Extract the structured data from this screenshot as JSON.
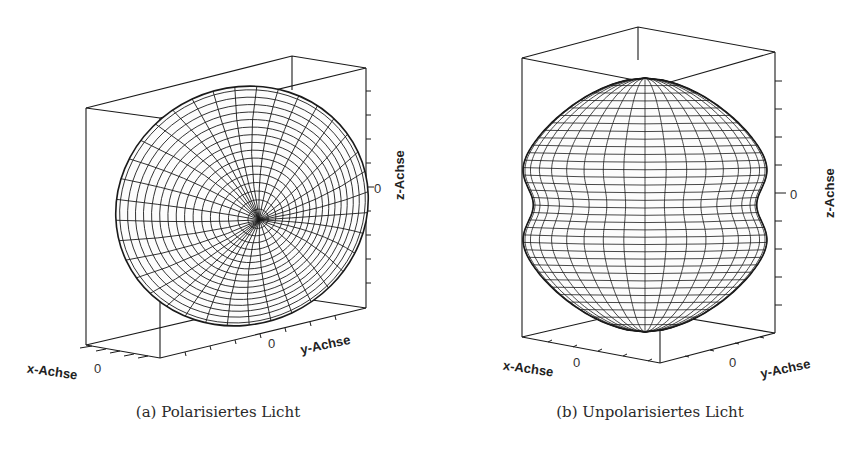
{
  "figures": [
    {
      "id": "a",
      "caption": "(a) Polarisiertes Licht",
      "axes": {
        "x_label": "x-Achse",
        "y_label": "y-Achse",
        "z_label": "z-Achse",
        "x_tick": "0",
        "y_tick": "0",
        "z_tick": "0"
      },
      "surface": "tilted ellipsoid wireframe (dipole radiation pattern, polarized light)"
    },
    {
      "id": "b",
      "caption": "(b) Unpolarisiertes Licht",
      "axes": {
        "x_label": "x-Achse",
        "y_label": "y-Achse",
        "z_label": "z-Achse",
        "x_tick": "0",
        "y_tick": "0",
        "z_tick": "0"
      },
      "surface": "peanut-shaped wireframe (radiation pattern, unpolarized light)"
    }
  ],
  "colors": {
    "line": "#1a1a1a",
    "background": "#ffffff"
  }
}
